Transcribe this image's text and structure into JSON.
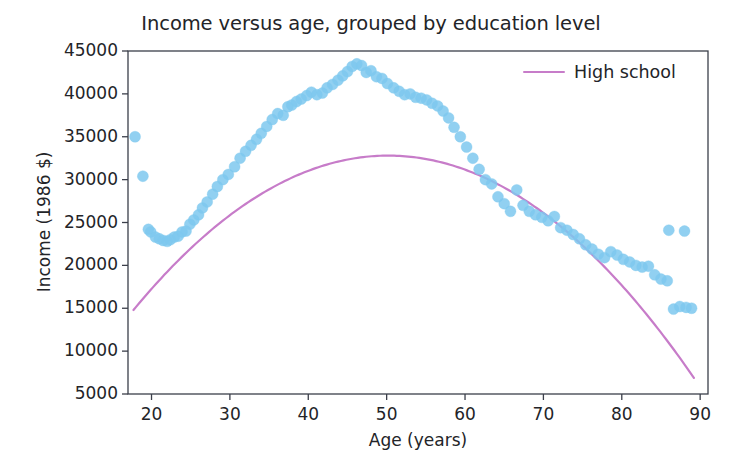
{
  "chart_data": {
    "type": "scatter",
    "title": "Income versus age, grouped by education level",
    "xlabel": "Age (years)",
    "ylabel": "Income (1986 $)",
    "xlim": [
      17,
      91
    ],
    "ylim": [
      5000,
      45000
    ],
    "xticks": [
      20,
      30,
      40,
      50,
      60,
      70,
      80,
      90
    ],
    "yticks": [
      5000,
      10000,
      15000,
      20000,
      25000,
      30000,
      35000,
      40000,
      45000
    ],
    "xticklabels": [
      "20",
      "30",
      "40",
      "50",
      "60",
      "70",
      "80",
      "90"
    ],
    "yticklabels": [
      "5000",
      "10000",
      "15000",
      "20000",
      "25000",
      "30000",
      "35000",
      "40000",
      "45000"
    ],
    "grid": false,
    "legend_position": "upper right",
    "legend": [
      {
        "name": "High school",
        "color": "#c77cc9",
        "marker": "line"
      }
    ],
    "scatter": {
      "name": "Income observations",
      "color": "#7ec8ef",
      "marker": "o",
      "marker_size": 11,
      "alpha": 0.85,
      "x": [
        17.9,
        18.9,
        19.6,
        19.9,
        20.5,
        21.0,
        21.5,
        22.0,
        22.4,
        22.9,
        23.4,
        23.9,
        24.4,
        24.9,
        25.4,
        26.0,
        26.5,
        27.1,
        27.8,
        28.4,
        29.1,
        29.8,
        30.6,
        31.3,
        32.0,
        32.7,
        33.4,
        34.0,
        34.7,
        35.4,
        36.1,
        36.8,
        37.4,
        37.9,
        38.5,
        39.1,
        39.8,
        40.4,
        41.1,
        41.8,
        42.4,
        43.1,
        43.8,
        44.4,
        45.0,
        45.6,
        46.2,
        46.8,
        47.4,
        48.0,
        48.7,
        49.4,
        50.1,
        50.9,
        51.6,
        52.3,
        53.0,
        53.7,
        54.4,
        55.1,
        55.8,
        56.5,
        57.2,
        57.9,
        58.6,
        59.4,
        60.2,
        61.0,
        61.8,
        62.6,
        63.4,
        64.2,
        65.0,
        65.8,
        66.6,
        67.4,
        68.2,
        69.0,
        69.8,
        70.6,
        71.4,
        72.2,
        73.0,
        73.8,
        74.6,
        75.4,
        76.2,
        77.0,
        77.8,
        78.6,
        79.4,
        80.2,
        81.0,
        81.8,
        82.6,
        83.4,
        84.2,
        85.0,
        85.8,
        86.6,
        87.4,
        88.2,
        88.9,
        86.0,
        88.0
      ],
      "y": [
        35000,
        30400,
        24200,
        23900,
        23300,
        23100,
        22900,
        22800,
        23000,
        23300,
        23400,
        23900,
        24000,
        24800,
        25300,
        25900,
        26700,
        27400,
        28300,
        29200,
        30000,
        30600,
        31500,
        32500,
        33300,
        34000,
        34700,
        35400,
        36200,
        37000,
        37700,
        37500,
        38500,
        38700,
        39100,
        39400,
        39800,
        40200,
        39900,
        40100,
        40700,
        41100,
        41600,
        42100,
        42600,
        43200,
        43500,
        43300,
        42500,
        42700,
        42000,
        41800,
        41200,
        40700,
        40300,
        39900,
        40000,
        39600,
        39500,
        39300,
        38900,
        38600,
        38000,
        37200,
        36100,
        35000,
        33800,
        32500,
        31200,
        30000,
        29500,
        28000,
        27200,
        26300,
        28800,
        27000,
        26300,
        25900,
        25600,
        25200,
        25700,
        24400,
        24100,
        23600,
        23100,
        22400,
        21900,
        21300,
        20900,
        21600,
        21200,
        20700,
        20400,
        20000,
        19800,
        19900,
        18900,
        18400,
        18200,
        14900,
        15200,
        15100,
        15000,
        24100,
        24000
      ]
    },
    "fit_curve": {
      "name": "High school",
      "color": "#c77cc9",
      "linewidth": 2.2,
      "type": "quadratic",
      "vertex_age": 50.2,
      "vertex_income": 32800,
      "x_start": 17.7,
      "y_start": 14800,
      "x_end": 89.2,
      "y_end": 7100
    }
  }
}
